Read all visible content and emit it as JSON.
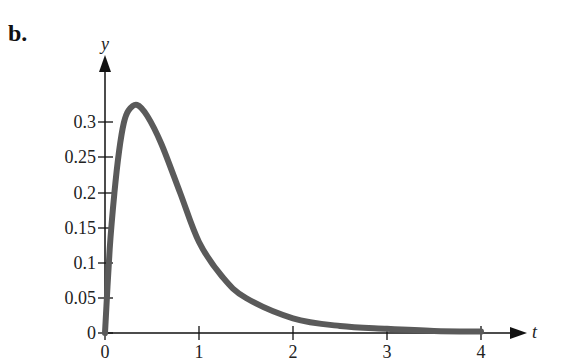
{
  "panel_label": "b.",
  "chart_data": {
    "type": "line",
    "title": "",
    "xlabel": "t",
    "ylabel": "y",
    "xlim": [
      0,
      4
    ],
    "ylim": [
      0,
      0.33
    ],
    "grid": false,
    "legend": null,
    "x_ticks": [
      0,
      1,
      2,
      3,
      4
    ],
    "x_tick_labels": [
      "0",
      "1",
      "2",
      "3",
      "4"
    ],
    "y_ticks": [
      0,
      0.05,
      0.1,
      0.15,
      0.2,
      0.25,
      0.3
    ],
    "y_tick_labels": [
      "0",
      "0.05",
      "0.1",
      "0.15",
      "0.2",
      "0.25",
      "0.3"
    ],
    "series": [
      {
        "name": "y(t)",
        "color": "#5a5a5a",
        "x": [
          0,
          0.05,
          0.1,
          0.15,
          0.2,
          0.25,
          0.34,
          0.45,
          0.6,
          0.8,
          1.0,
          1.25,
          1.5,
          2.0,
          2.5,
          3.0,
          3.5,
          4.0
        ],
        "y": [
          0,
          0.12,
          0.2,
          0.26,
          0.3,
          0.318,
          0.326,
          0.31,
          0.27,
          0.2,
          0.13,
          0.08,
          0.05,
          0.021,
          0.01,
          0.006,
          0.003,
          0.002
        ]
      }
    ]
  },
  "labels": {
    "x0": "0",
    "x1": "1",
    "x2": "2",
    "x3": "3",
    "x4": "4",
    "y0": "0",
    "y005": "0.05",
    "y01": "0.1",
    "y015": "0.15",
    "y02": "0.2",
    "y025": "0.25",
    "y03": "0.3",
    "xaxis": "t",
    "yaxis": "y"
  }
}
